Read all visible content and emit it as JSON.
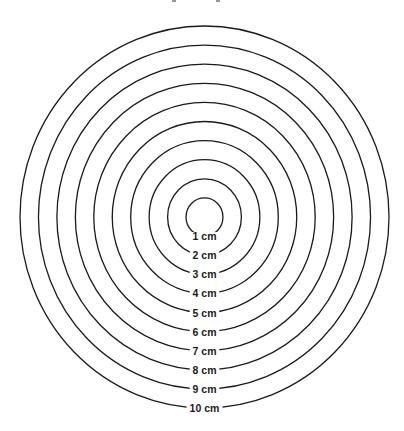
{
  "diagram": {
    "unit": "cm",
    "stroke_color": "#1a1a1a",
    "background_color": "#ffffff",
    "rings": [
      {
        "radius": 1,
        "label": "1 cm"
      },
      {
        "radius": 2,
        "label": "2 cm"
      },
      {
        "radius": 3,
        "label": "3 cm"
      },
      {
        "radius": 4,
        "label": "4 cm"
      },
      {
        "radius": 5,
        "label": "5 cm"
      },
      {
        "radius": 6,
        "label": "6 cm"
      },
      {
        "radius": 7,
        "label": "7 cm"
      },
      {
        "radius": 8,
        "label": "8 cm"
      },
      {
        "radius": 9,
        "label": "9 cm"
      },
      {
        "radius": 10,
        "label": "10 cm"
      }
    ]
  }
}
